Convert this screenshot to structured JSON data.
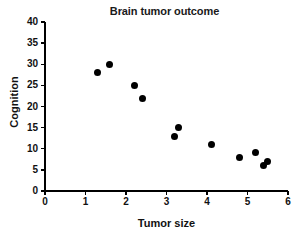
{
  "chart_data": {
    "type": "scatter",
    "title": "Brain tumor outcome",
    "xlabel": "Tumor size",
    "ylabel": "Cognition",
    "xlim": [
      0,
      6
    ],
    "ylim": [
      0,
      40
    ],
    "xticks": [
      "0",
      "1",
      "2",
      "3",
      "4",
      "5",
      "6"
    ],
    "xtick_values": [
      0,
      1,
      2,
      3,
      4,
      5,
      6
    ],
    "yticks": [
      "0",
      "5",
      "10",
      "15",
      "20",
      "25",
      "30",
      "35",
      "40"
    ],
    "ytick_values": [
      0,
      5,
      10,
      15,
      20,
      25,
      30,
      35,
      40
    ],
    "grid": false,
    "legend": null,
    "marker_color": "#000000",
    "marker_shape": "circle",
    "series": [
      {
        "name": "Patients",
        "points": [
          {
            "x": 1.3,
            "y": 28
          },
          {
            "x": 1.6,
            "y": 30
          },
          {
            "x": 2.2,
            "y": 25
          },
          {
            "x": 2.4,
            "y": 22
          },
          {
            "x": 3.2,
            "y": 13
          },
          {
            "x": 3.3,
            "y": 15
          },
          {
            "x": 4.1,
            "y": 11
          },
          {
            "x": 4.8,
            "y": 8
          },
          {
            "x": 5.2,
            "y": 9
          },
          {
            "x": 5.4,
            "y": 6
          },
          {
            "x": 5.5,
            "y": 7
          }
        ]
      }
    ]
  }
}
